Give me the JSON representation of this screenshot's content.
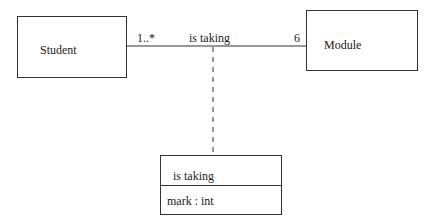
{
  "diagram": {
    "type": "UML class diagram with association class",
    "classes": [
      {
        "id": "student",
        "name": "Student"
      },
      {
        "id": "module",
        "name": "Module"
      }
    ],
    "association": {
      "name": "is taking",
      "source_multiplicity": "1..*",
      "target_multiplicity": "6"
    },
    "association_class": {
      "name": "is taking",
      "attributes": [
        "mark : int"
      ]
    },
    "colors": {
      "line": "#333333",
      "text": "#1a1a1a",
      "background": "#ffffff"
    }
  }
}
